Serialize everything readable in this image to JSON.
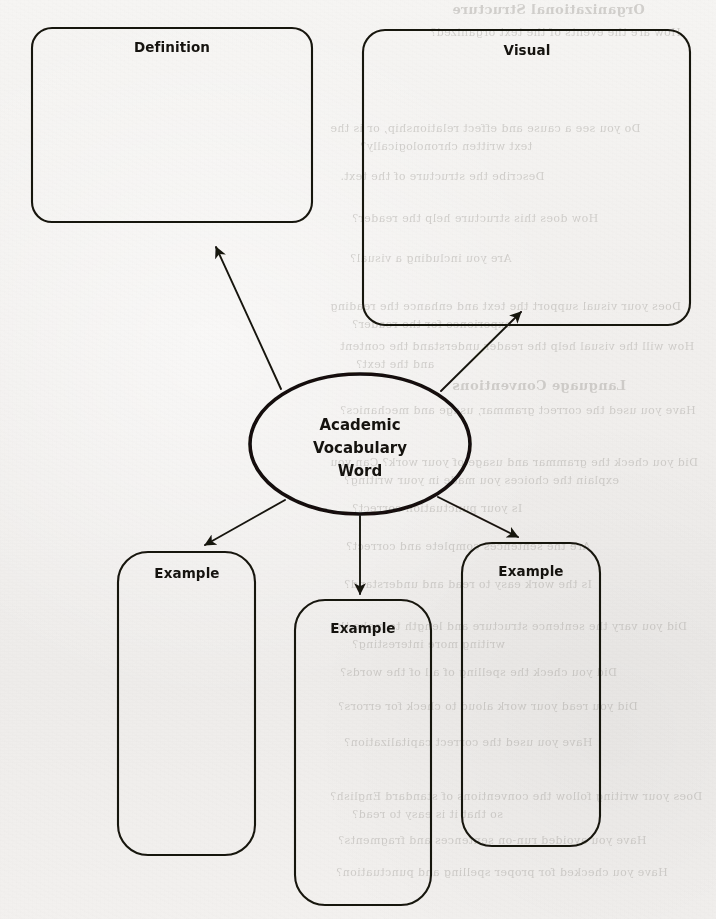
{
  "worksheet": {
    "title_implied": "Academic Vocabulary Word graphic organizer",
    "background_color": "#f2f0ee",
    "ink_color": "#1a1713"
  },
  "center_node": {
    "name": "center-ellipse",
    "shape": "ellipse",
    "lines": [
      "Academic",
      "Vocabulary",
      "Word"
    ],
    "line1": "Academic",
    "line2": "Vocabulary",
    "line3": "Word",
    "cx": 360,
    "cy": 444,
    "rx": 110,
    "ry": 70,
    "stroke_width": 3.6
  },
  "boxes": [
    {
      "id": "definition",
      "label": "Definition",
      "x": 32,
      "y": 28,
      "w": 280,
      "h": 194,
      "r": 20,
      "label_x": 172,
      "label_y": 52
    },
    {
      "id": "visual",
      "label": "Visual",
      "x": 363,
      "y": 30,
      "w": 327,
      "h": 295,
      "r": 22,
      "label_x": 527,
      "label_y": 55
    },
    {
      "id": "example-left",
      "label": "Example",
      "x": 118,
      "y": 552,
      "w": 137,
      "h": 303,
      "r": 30,
      "label_x": 187,
      "label_y": 578
    },
    {
      "id": "example-middle",
      "label": "Example",
      "x": 295,
      "y": 600,
      "w": 136,
      "h": 305,
      "r": 30,
      "label_x": 363,
      "label_y": 633
    },
    {
      "id": "example-right",
      "label": "Example",
      "x": 462,
      "y": 543,
      "w": 138,
      "h": 303,
      "r": 30,
      "label_x": 531,
      "label_y": 576
    }
  ],
  "arrows": [
    {
      "id": "arrow-to-definition",
      "from": [
        281,
        389
      ],
      "to": [
        216,
        247
      ]
    },
    {
      "id": "arrow-to-visual",
      "from": [
        441,
        391
      ],
      "to": [
        521,
        312
      ]
    },
    {
      "id": "arrow-to-example-left",
      "from": [
        285,
        500
      ],
      "to": [
        205,
        545
      ]
    },
    {
      "id": "arrow-to-example-middle",
      "from": [
        360,
        516
      ],
      "to": [
        360,
        594
      ]
    },
    {
      "id": "arrow-to-example-right",
      "from": [
        438,
        497
      ],
      "to": [
        518,
        537
      ]
    }
  ],
  "bleed_through": [
    {
      "text": "Organizational Structure",
      "x": 452,
      "y": 2,
      "size": 13,
      "bold": true
    },
    {
      "text": "How are the events of the text organized?",
      "x": 430,
      "y": 26,
      "size": 11,
      "bold": false
    },
    {
      "text": "Do you see a cause and effect relationship, or is the",
      "x": 330,
      "y": 122,
      "size": 11,
      "bold": false
    },
    {
      "text": "text written chronologically?",
      "x": 360,
      "y": 140,
      "size": 11,
      "bold": false
    },
    {
      "text": "Describe the structure of the text.",
      "x": 340,
      "y": 170,
      "size": 11,
      "bold": false
    },
    {
      "text": "How does this structure help the reader?",
      "x": 352,
      "y": 212,
      "size": 11,
      "bold": false
    },
    {
      "text": "Are you including a visual?",
      "x": 350,
      "y": 252,
      "size": 11,
      "bold": false
    },
    {
      "text": "Does your visual support the text and enhance the reading",
      "x": 330,
      "y": 300,
      "size": 11,
      "bold": false
    },
    {
      "text": "experience for the reader?",
      "x": 352,
      "y": 318,
      "size": 11,
      "bold": false
    },
    {
      "text": "How will the visual help the reader understand the content",
      "x": 340,
      "y": 340,
      "size": 11,
      "bold": false
    },
    {
      "text": "and the text?",
      "x": 356,
      "y": 358,
      "size": 11,
      "bold": false
    },
    {
      "text": "Language Conventions",
      "x": 452,
      "y": 378,
      "size": 13,
      "bold": true
    },
    {
      "text": "Have you used the correct grammar, usage and mechanics?",
      "x": 340,
      "y": 404,
      "size": 11,
      "bold": false
    },
    {
      "text": "Did you check the grammar and usage of your work? Can you",
      "x": 330,
      "y": 456,
      "size": 11,
      "bold": false
    },
    {
      "text": "explain the choices you made in your writing?",
      "x": 344,
      "y": 474,
      "size": 11,
      "bold": false
    },
    {
      "text": "Is your punctuation correct?",
      "x": 352,
      "y": 502,
      "size": 11,
      "bold": false
    },
    {
      "text": "Are the sentences complete and correct?",
      "x": 346,
      "y": 540,
      "size": 11,
      "bold": false
    },
    {
      "text": "Is the work easy to read and understand?",
      "x": 344,
      "y": 578,
      "size": 11,
      "bold": false
    },
    {
      "text": "Did you vary the sentence structure and length to make the",
      "x": 330,
      "y": 620,
      "size": 11,
      "bold": false
    },
    {
      "text": "writing more interesting?",
      "x": 352,
      "y": 638,
      "size": 11,
      "bold": false
    },
    {
      "text": "Did you check the spelling of all of the words?",
      "x": 340,
      "y": 666,
      "size": 11,
      "bold": false
    },
    {
      "text": "Did you read your work aloud to check for errors?",
      "x": 338,
      "y": 700,
      "size": 11,
      "bold": false
    },
    {
      "text": "Have you used the correct capitalization?",
      "x": 344,
      "y": 736,
      "size": 11,
      "bold": false
    },
    {
      "text": "Does your writing follow the conventions of standard English?",
      "x": 330,
      "y": 790,
      "size": 11,
      "bold": false
    },
    {
      "text": "so that it is easy to read?",
      "x": 352,
      "y": 808,
      "size": 11,
      "bold": false
    },
    {
      "text": "Have you avoided run-on sentences and fragments?",
      "x": 338,
      "y": 834,
      "size": 11,
      "bold": false
    },
    {
      "text": "Have you checked for proper spelling and punctuation?",
      "x": 336,
      "y": 866,
      "size": 11,
      "bold": false
    }
  ]
}
